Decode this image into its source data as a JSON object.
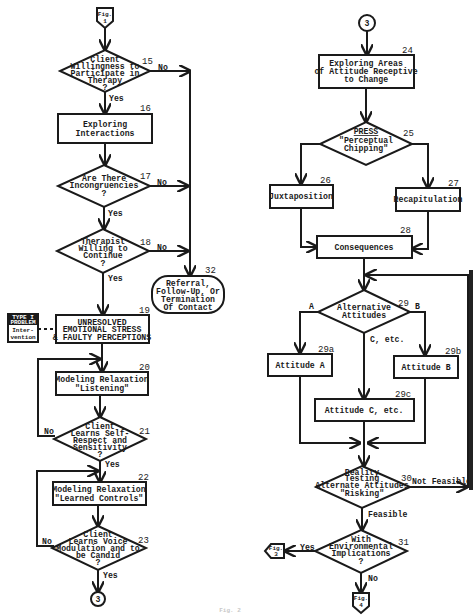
{
  "figure_caption": "Fig. 2",
  "connectors": {
    "top_in": {
      "line1": "Fig.",
      "line2": "1"
    },
    "left_out": {
      "label": "3"
    },
    "right_in": {
      "label": "3"
    },
    "fig3_out": {
      "line1": "Fig.",
      "line2": "3"
    },
    "fig4_out": {
      "line1": "Fig.",
      "line2": "4"
    }
  },
  "nodes": {
    "n15": {
      "num": "15",
      "lines": [
        "Client",
        "Willingness to",
        "Participate in",
        "Therapy",
        "?"
      ]
    },
    "n16": {
      "num": "16",
      "lines": [
        "Exploring",
        "Interactions"
      ]
    },
    "n17": {
      "num": "17",
      "lines": [
        "Are There",
        "Incongruencies",
        "?"
      ]
    },
    "n18": {
      "num": "18",
      "lines": [
        "Therapist",
        "Willing  to",
        "Continue",
        "?"
      ]
    },
    "n19": {
      "num": "19",
      "lines": [
        "UNRESOLVED",
        "EMOTIONAL STRESS",
        "& FAULTY PERCEPTIONS"
      ]
    },
    "n20": {
      "num": "20",
      "lines": [
        "Modeling Relaxation",
        "\"Listening\""
      ]
    },
    "n21": {
      "num": "21",
      "lines": [
        "Client",
        "Learns Self-",
        "Respect and",
        "Sensitivity",
        "?"
      ]
    },
    "n22": {
      "num": "22",
      "lines": [
        "Modeling Relaxation",
        "\"Learned Controls\""
      ]
    },
    "n23": {
      "num": "23",
      "lines": [
        "Client",
        "Learns Voice",
        "Modulation and to",
        "be Candid",
        "?"
      ]
    },
    "n32": {
      "num": "32",
      "lines": [
        "Referral,",
        "Follow-Up, Or",
        "Termination",
        "Of  Contact"
      ]
    },
    "n24": {
      "num": "24",
      "lines": [
        "Exploring  Areas",
        "of Attitude Receptive",
        "to  Change"
      ]
    },
    "n25": {
      "num": "25",
      "lines": [
        "PRESS",
        "\"Perceptual",
        "Chipping\""
      ]
    },
    "n26": {
      "num": "26",
      "lines": [
        "Juxtaposition"
      ]
    },
    "n27": {
      "num": "27",
      "lines": [
        "Recapitulation"
      ]
    },
    "n28": {
      "num": "28",
      "lines": [
        "Consequences"
      ]
    },
    "n29": {
      "num": "29",
      "lines": [
        "Alternative",
        "Attitudes"
      ]
    },
    "n29a": {
      "num": "29a",
      "lines": [
        "Attitude A"
      ]
    },
    "n29b": {
      "num": "29b",
      "lines": [
        "Attitude B"
      ]
    },
    "n29c": {
      "num": "29c",
      "lines": [
        "Attitude C,  etc."
      ]
    },
    "n30": {
      "num": "30",
      "lines": [
        "Reality",
        "Testing",
        "Alternate Attitudes",
        "\"Risking\""
      ]
    },
    "n31": {
      "num": "31",
      "lines": [
        "With",
        "Environmental",
        "Implications",
        "?"
      ]
    }
  },
  "side_note": {
    "lines": [
      "TYPE  I",
      "PROBLEM",
      "Inter-",
      "vention"
    ]
  },
  "edge_labels": {
    "no": "No",
    "yes": "Yes",
    "a": "A",
    "b": "B",
    "c_etc": "C, etc.",
    "feasible": "Feasible",
    "not_feasible": "Not Feasible"
  }
}
